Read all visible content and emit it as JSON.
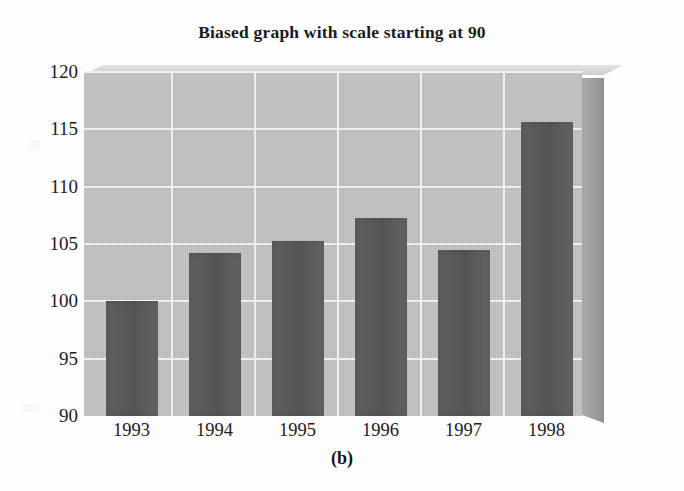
{
  "figure": {
    "caption": "(b)",
    "background_color": "#fdfdfd"
  },
  "chart_data": {
    "type": "bar",
    "title": "Biased graph with scale starting at 90",
    "xlabel": "",
    "ylabel": "",
    "categories": [
      "1993",
      "1994",
      "1995",
      "1996",
      "1997",
      "1998"
    ],
    "values": [
      100.0,
      104.2,
      105.3,
      107.3,
      104.5,
      115.6
    ],
    "ylim": [
      90,
      120
    ],
    "yticks": [
      90,
      95,
      100,
      105,
      110,
      115,
      120
    ],
    "ytick_labels": [
      "90",
      "95",
      "100",
      "105",
      "110",
      "115",
      "120"
    ],
    "grid": true,
    "grid_color": "#f1f1f1",
    "legend": null,
    "bar_color": "#585858",
    "plot_background_color": "#c3c3c3",
    "three_d": true,
    "note": "Truncated y-axis starting at 90 exaggerates differences between years"
  }
}
